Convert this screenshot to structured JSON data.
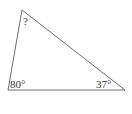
{
  "diagram": {
    "type": "triangle",
    "stroke_color": "#6e6e6e",
    "vertices": {
      "top": {
        "x": 22,
        "y": 10
      },
      "bottom_left": {
        "x": 8,
        "y": 90
      },
      "bottom_right": {
        "x": 125,
        "y": 90
      }
    },
    "angles": {
      "top": "?",
      "bottom_left": "80°",
      "bottom_right": "37°"
    }
  }
}
